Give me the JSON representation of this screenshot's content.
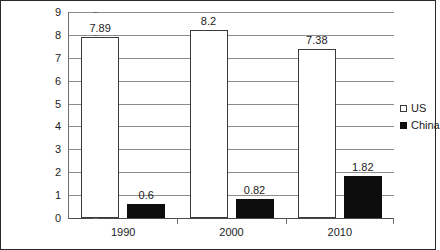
{
  "chart_data": {
    "type": "bar",
    "title": "",
    "subtitle": "",
    "xlabel": "",
    "ylabel": "",
    "categories": [
      "1990",
      "2000",
      "2010"
    ],
    "series": [
      {
        "name": "US",
        "values": [
          7.89,
          8.2,
          7.38
        ],
        "color": "#ffffff",
        "edge_color": "#3a3a3a"
      },
      {
        "name": "China",
        "values": [
          0.6,
          0.82,
          1.82
        ],
        "color": "#0d0d0d",
        "edge_color": "#0d0d0d"
      }
    ],
    "data_labels": {
      "US": [
        "7.89",
        "8.2",
        "7.38"
      ],
      "China": [
        "0.6",
        "0.82",
        "1.82"
      ]
    },
    "ylim": [
      0,
      9
    ],
    "yticks": [
      0,
      1,
      2,
      3,
      4,
      5,
      6,
      7,
      8,
      9
    ],
    "ytick_labels": [
      "0",
      "1",
      "2",
      "3",
      "4",
      "5",
      "6",
      "7",
      "8",
      "9"
    ],
    "grid": "horizontal",
    "legend_position": "right",
    "legend_entries": [
      "US",
      "China"
    ],
    "frame": "full-border"
  }
}
